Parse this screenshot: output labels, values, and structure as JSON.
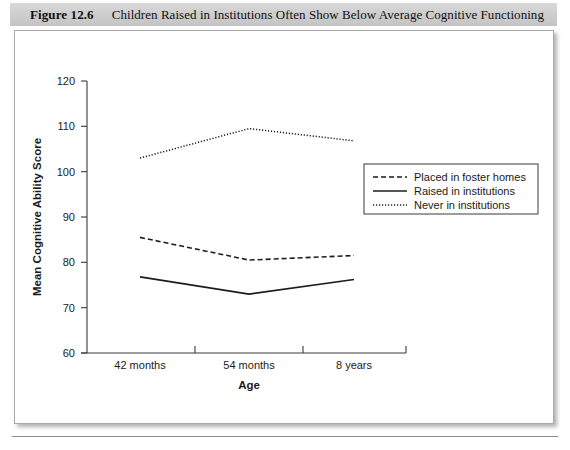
{
  "figure": {
    "number_label": "Figure 12.6",
    "caption": "Children Raised in Institutions Often Show Below Average Cognitive Functioning"
  },
  "chart_data": {
    "type": "line",
    "title": "",
    "xlabel": "Age",
    "ylabel": "Mean Cognitive Ability Score",
    "categories": [
      "42 months",
      "54 months",
      "8 years"
    ],
    "ylim": [
      60,
      120
    ],
    "yticks": [
      "60",
      "70",
      "80",
      "90",
      "100",
      "110",
      "120"
    ],
    "grid": false,
    "legend_position": "right",
    "series": [
      {
        "name": "Placed in foster homes",
        "style": "dashed",
        "color": "#1c1c1c",
        "values": [
          85.5,
          80.5,
          81.5
        ]
      },
      {
        "name": "Raised in institutions",
        "style": "solid",
        "color": "#1c1c1c",
        "values": [
          76.8,
          73.0,
          76.2
        ]
      },
      {
        "name": "Never in institutions",
        "style": "dotted",
        "color": "#1c1c1c",
        "values": [
          103.0,
          109.5,
          106.8
        ]
      }
    ]
  }
}
